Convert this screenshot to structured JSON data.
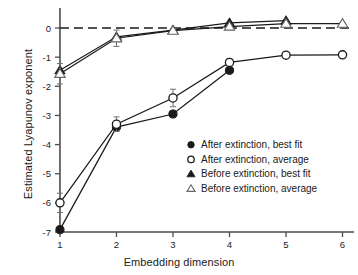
{
  "chart_data": {
    "type": "line",
    "title": "",
    "xlabel": "Embedding dimension",
    "ylabel": "Estimated Lyapunov exponent",
    "x": [
      1,
      2,
      3,
      4,
      5,
      6
    ],
    "xlim": [
      0.7,
      6.15
    ],
    "ylim": [
      -7.0,
      0.55
    ],
    "xticks": [
      "1",
      "2",
      "3",
      "4",
      "5",
      "6"
    ],
    "yticks": [
      "0",
      "-1",
      "-2",
      "-3",
      "-4",
      "-5",
      "-6",
      "-7"
    ],
    "ytick_values": [
      0,
      -1,
      -2,
      -3,
      -4,
      -5,
      -6,
      -7
    ],
    "grid": false,
    "zero_reference_line": 0,
    "zero_line_style": "dashed",
    "legend_position": "center-right",
    "series": [
      {
        "name": "After extinction, best fit",
        "marker": "filled-circle",
        "x": [
          1,
          2,
          3,
          4
        ],
        "values": [
          -6.92,
          -3.4,
          -2.95,
          -1.45
        ],
        "errors": [
          0,
          0,
          0,
          0
        ]
      },
      {
        "name": "After extinction, average",
        "marker": "open-circle",
        "x": [
          1,
          2,
          3,
          4,
          5,
          6
        ],
        "values": [
          -6.0,
          -3.3,
          -2.4,
          -1.18,
          -0.93,
          -0.92
        ],
        "errors": [
          0.33,
          0.25,
          0.3,
          0.12,
          0.06,
          0.05
        ]
      },
      {
        "name": "Before extinction, best fit",
        "marker": "filled-triangle",
        "x": [
          1,
          2,
          3,
          4,
          5
        ],
        "values": [
          -1.45,
          -0.3,
          -0.07,
          0.18,
          0.25
        ],
        "errors": [
          0,
          0,
          0,
          0,
          0
        ]
      },
      {
        "name": "Before extinction, average",
        "marker": "open-triangle",
        "x": [
          1,
          2,
          3,
          4,
          5,
          6
        ],
        "values": [
          -1.57,
          -0.35,
          -0.09,
          0.05,
          0.15,
          0.15
        ],
        "errors": [
          0.35,
          0.28,
          0.07,
          0.05,
          0.04,
          0.04
        ]
      }
    ],
    "legend_entries": [
      {
        "label": "After extinction, best fit",
        "marker": "filled-circle"
      },
      {
        "label": "After extinction, average",
        "marker": "open-circle"
      },
      {
        "label": "Before extinction, best fit",
        "marker": "filled-triangle"
      },
      {
        "label": "Before extinction, average",
        "marker": "open-triangle"
      }
    ],
    "colors": {
      "line": "#1a1a1a",
      "marker_fill": "#1a1a1a",
      "marker_open_fill": "#ffffff",
      "axis": "#4d4d4d",
      "text": "#1a1a1a"
    }
  }
}
